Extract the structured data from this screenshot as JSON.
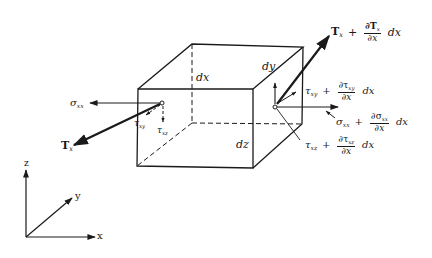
{
  "diagram": {
    "element": {
      "edge_labels": {
        "dx": "dx",
        "dy": "dy",
        "dz": "dz"
      }
    },
    "left_face": {
      "sigma": {
        "symbol": "σ",
        "sub": "xx"
      },
      "tau_xy": {
        "symbol": "τ",
        "sub": "xy"
      },
      "tau_xz": {
        "symbol": "τ",
        "sub": "xz"
      },
      "traction": {
        "symbol": "T",
        "sub": "x"
      }
    },
    "right_face": {
      "traction": {
        "base": "T",
        "base_sub": "x",
        "plus": "+",
        "num": "∂T",
        "num_sub": "x",
        "den": "∂x",
        "tail": "dx"
      },
      "tau_xy": {
        "base": "τ",
        "base_sub": "xy",
        "plus": "+",
        "num": "∂τ",
        "num_sub": "xy",
        "den": "∂x",
        "tail": "dx"
      },
      "sigma": {
        "base": "σ",
        "base_sub": "xx",
        "plus": "+",
        "num": "∂σ",
        "num_sub": "xx",
        "den": "∂x",
        "tail": "dx"
      },
      "tau_xz": {
        "base": "τ",
        "base_sub": "xz",
        "plus": "+",
        "num": "∂τ",
        "num_sub": "xz",
        "den": "∂x",
        "tail": "dx"
      }
    },
    "axes": {
      "x": "x",
      "y": "y",
      "z": "z"
    },
    "colors": {
      "ink": "#1a1a1a",
      "background": "#ffffff"
    }
  }
}
